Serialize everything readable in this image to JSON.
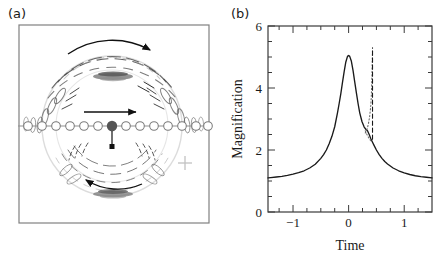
{
  "figure": {
    "panels": [
      {
        "id": "a",
        "label": "(a)",
        "type": "diagram",
        "description": "gravitational-lens-image-configuration",
        "elements": {
          "source_track_circles_count": 13,
          "lens_center_marker": "filled-dot",
          "top_arrow_label": "",
          "bottom_arrow_label": "",
          "motion_arrow_label": "",
          "cross_marker": "+"
        }
      },
      {
        "id": "b",
        "label": "(b)",
        "type": "chart"
      }
    ]
  },
  "chart_data": {
    "type": "line",
    "title": "",
    "xlabel": "Time",
    "ylabel": "Magnification",
    "xlim": [
      -1.45,
      1.5
    ],
    "ylim": [
      0,
      6
    ],
    "xticks_major": [
      -1,
      0,
      1
    ],
    "xticklabels": [
      "−1",
      "0",
      "1"
    ],
    "xticks_minor": [
      -1.25,
      -0.75,
      -0.5,
      -0.25,
      0.25,
      0.5,
      0.75,
      1.25
    ],
    "yticks_major": [
      0,
      2,
      4,
      6
    ],
    "yticklabels": [
      "0",
      "2",
      "4",
      "6"
    ],
    "yticks_minor": [
      0.5,
      1,
      1.5,
      2.5,
      3,
      3.5,
      4.5,
      5,
      5.5
    ],
    "grid": false,
    "legend": null,
    "series": [
      {
        "name": "magnification-light-curve",
        "style": "solid",
        "color": "#1a1a1a",
        "x": [
          -1.45,
          -1.4,
          -1.3,
          -1.2,
          -1.1,
          -1.0,
          -0.9,
          -0.8,
          -0.7,
          -0.6,
          -0.5,
          -0.45,
          -0.4,
          -0.35,
          -0.3,
          -0.25,
          -0.2,
          -0.17,
          -0.14,
          -0.11,
          -0.08,
          -0.05,
          -0.02,
          0.0,
          0.02,
          0.05,
          0.08,
          0.11,
          0.14,
          0.17,
          0.2,
          0.24,
          0.28,
          0.31,
          0.34,
          0.37,
          0.4,
          0.43,
          0.46,
          0.5,
          0.55,
          0.6,
          0.65,
          0.7,
          0.8,
          0.9,
          1.0,
          1.1,
          1.2,
          1.3,
          1.4,
          1.5
        ],
        "y": [
          1.1,
          1.11,
          1.13,
          1.15,
          1.18,
          1.22,
          1.27,
          1.33,
          1.42,
          1.54,
          1.73,
          1.85,
          2.0,
          2.2,
          2.44,
          2.75,
          3.2,
          3.5,
          3.82,
          4.18,
          4.53,
          4.84,
          5.02,
          5.05,
          5.02,
          4.86,
          4.56,
          4.2,
          3.84,
          3.5,
          3.2,
          2.92,
          2.74,
          2.67,
          2.62,
          2.5,
          2.36,
          2.25,
          2.14,
          2.0,
          1.85,
          1.73,
          1.63,
          1.55,
          1.42,
          1.33,
          1.26,
          1.21,
          1.17,
          1.14,
          1.12,
          1.1
        ]
      },
      {
        "name": "caustic-crossing-dotted-branch",
        "style": "dotted",
        "color": "#6b6b6b",
        "x": [
          0.3,
          0.32,
          0.34,
          0.36,
          0.38,
          0.4,
          0.41,
          0.42,
          0.425,
          0.43
        ],
        "y": [
          2.55,
          2.62,
          2.72,
          2.88,
          3.1,
          3.45,
          3.8,
          4.4,
          4.85,
          5.2
        ]
      },
      {
        "name": "caustic-crossing-dashed-vertical",
        "style": "dashed",
        "color": "#1a1a1a",
        "x": [
          0.43,
          0.43
        ],
        "y": [
          2.35,
          5.3
        ]
      },
      {
        "name": "caustic-crossing-short-branch",
        "style": "dotted",
        "color": "#6b6b6b",
        "x": [
          0.3,
          0.33,
          0.36,
          0.39,
          0.42
        ],
        "y": [
          2.62,
          2.5,
          2.4,
          2.32,
          2.26
        ]
      }
    ]
  }
}
